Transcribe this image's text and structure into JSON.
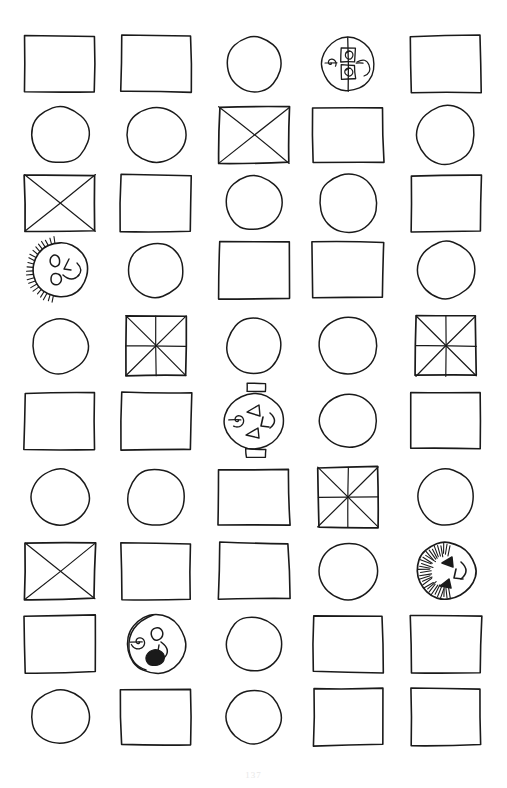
{
  "page": {
    "width": 507,
    "height": 788,
    "background_color": "#ffffff",
    "ink_color": "#1a1a1a",
    "page_number": "137"
  },
  "grid": {
    "rows": 10,
    "columns": 5,
    "col_centers": [
      60,
      156,
      254,
      348,
      446
    ],
    "row_centers": [
      64,
      135,
      203,
      270,
      346,
      421,
      497,
      571,
      644,
      717
    ],
    "cell_width": 70,
    "cell_height": 56
  },
  "legend": {
    "rectangle": "plain hand-drawn rectangle",
    "circle": "plain hand-drawn circle",
    "x-square": "rectangle with an X drawn corner to corner",
    "star-square": "square divided by both diagonals plus a vertical and horizontal line (8 sectors)",
    "gear-circle": "circle containing two small squares linked by a vertical line with curls left and right",
    "smiley-face": "circle with two eyes, a nose, a smile and shading hatch marks on the left rim",
    "jack-o-lantern": "circle with stem and base tabs, triangle eyes, triangle nose, toothy mouth and a spiral curl",
    "jack-o-lantern-hatched": "circle with triangle eyes, triangle nose, a smile and dense hatching on the left rim",
    "blob-face": "circle with a spiral curl, one round eye, a smile and a solid filled black blob"
  },
  "cells": [
    {
      "row": 1,
      "col": 1,
      "shape": "rectangle",
      "label": "rectangle"
    },
    {
      "row": 1,
      "col": 2,
      "shape": "rectangle",
      "label": "rectangle"
    },
    {
      "row": 1,
      "col": 3,
      "shape": "circle",
      "label": "circle"
    },
    {
      "row": 1,
      "col": 4,
      "shape": "gear-circle",
      "label": "gear-circle"
    },
    {
      "row": 1,
      "col": 5,
      "shape": "rectangle",
      "label": "rectangle"
    },
    {
      "row": 2,
      "col": 1,
      "shape": "circle",
      "label": "circle"
    },
    {
      "row": 2,
      "col": 2,
      "shape": "circle",
      "label": "circle"
    },
    {
      "row": 2,
      "col": 3,
      "shape": "x-square",
      "label": "x-square"
    },
    {
      "row": 2,
      "col": 4,
      "shape": "rectangle",
      "label": "rectangle"
    },
    {
      "row": 2,
      "col": 5,
      "shape": "circle",
      "label": "circle"
    },
    {
      "row": 3,
      "col": 1,
      "shape": "x-square",
      "label": "x-square"
    },
    {
      "row": 3,
      "col": 2,
      "shape": "rectangle",
      "label": "rectangle"
    },
    {
      "row": 3,
      "col": 3,
      "shape": "circle",
      "label": "circle"
    },
    {
      "row": 3,
      "col": 4,
      "shape": "circle",
      "label": "circle"
    },
    {
      "row": 3,
      "col": 5,
      "shape": "rectangle",
      "label": "rectangle"
    },
    {
      "row": 4,
      "col": 1,
      "shape": "smiley-face",
      "label": "smiley-face"
    },
    {
      "row": 4,
      "col": 2,
      "shape": "circle",
      "label": "circle"
    },
    {
      "row": 4,
      "col": 3,
      "shape": "rectangle",
      "label": "rectangle"
    },
    {
      "row": 4,
      "col": 4,
      "shape": "rectangle",
      "label": "rectangle"
    },
    {
      "row": 4,
      "col": 5,
      "shape": "circle",
      "label": "circle"
    },
    {
      "row": 5,
      "col": 1,
      "shape": "circle",
      "label": "circle"
    },
    {
      "row": 5,
      "col": 2,
      "shape": "star-square",
      "label": "star-square"
    },
    {
      "row": 5,
      "col": 3,
      "shape": "circle",
      "label": "circle"
    },
    {
      "row": 5,
      "col": 4,
      "shape": "circle",
      "label": "circle"
    },
    {
      "row": 5,
      "col": 5,
      "shape": "star-square",
      "label": "star-square"
    },
    {
      "row": 6,
      "col": 1,
      "shape": "rectangle",
      "label": "rectangle"
    },
    {
      "row": 6,
      "col": 2,
      "shape": "rectangle",
      "label": "rectangle"
    },
    {
      "row": 6,
      "col": 3,
      "shape": "jack-o-lantern",
      "label": "jack-o-lantern"
    },
    {
      "row": 6,
      "col": 4,
      "shape": "circle",
      "label": "circle"
    },
    {
      "row": 6,
      "col": 5,
      "shape": "rectangle",
      "label": "rectangle"
    },
    {
      "row": 7,
      "col": 1,
      "shape": "circle",
      "label": "circle"
    },
    {
      "row": 7,
      "col": 2,
      "shape": "circle",
      "label": "circle"
    },
    {
      "row": 7,
      "col": 3,
      "shape": "rectangle",
      "label": "rectangle"
    },
    {
      "row": 7,
      "col": 4,
      "shape": "star-square",
      "label": "star-square"
    },
    {
      "row": 7,
      "col": 5,
      "shape": "circle",
      "label": "circle"
    },
    {
      "row": 8,
      "col": 1,
      "shape": "x-square",
      "label": "x-square"
    },
    {
      "row": 8,
      "col": 2,
      "shape": "rectangle",
      "label": "rectangle"
    },
    {
      "row": 8,
      "col": 3,
      "shape": "rectangle",
      "label": "rectangle"
    },
    {
      "row": 8,
      "col": 4,
      "shape": "circle",
      "label": "circle"
    },
    {
      "row": 8,
      "col": 5,
      "shape": "jack-o-lantern-hatched",
      "label": "jack-o-lantern-hatched"
    },
    {
      "row": 9,
      "col": 1,
      "shape": "rectangle",
      "label": "rectangle"
    },
    {
      "row": 9,
      "col": 2,
      "shape": "blob-face",
      "label": "blob-face"
    },
    {
      "row": 9,
      "col": 3,
      "shape": "circle",
      "label": "circle"
    },
    {
      "row": 9,
      "col": 4,
      "shape": "rectangle",
      "label": "rectangle"
    },
    {
      "row": 9,
      "col": 5,
      "shape": "rectangle",
      "label": "rectangle"
    },
    {
      "row": 10,
      "col": 1,
      "shape": "circle",
      "label": "circle"
    },
    {
      "row": 10,
      "col": 2,
      "shape": "rectangle",
      "label": "rectangle"
    },
    {
      "row": 10,
      "col": 3,
      "shape": "circle",
      "label": "circle"
    },
    {
      "row": 10,
      "col": 4,
      "shape": "rectangle",
      "label": "rectangle"
    },
    {
      "row": 10,
      "col": 5,
      "shape": "rectangle",
      "label": "rectangle"
    }
  ]
}
